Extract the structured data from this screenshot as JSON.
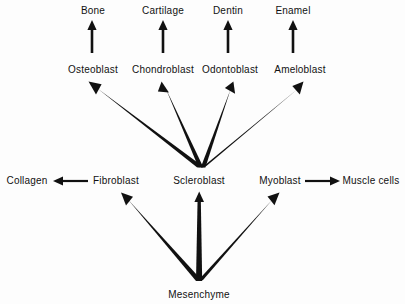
{
  "diagram": {
    "background_color": "#fdfdfd",
    "stroke_color": "#111111",
    "nodes": {
      "bone": "Bone",
      "cartilage": "Cartilage",
      "dentin": "Dentin",
      "enamel": "Enamel",
      "osteoblast": "Osteoblast",
      "chondroblast": "Chondroblast",
      "odontoblast": "Odontoblast",
      "ameloblast": "Ameloblast",
      "collagen": "Collagen",
      "fibroblast": "Fibroblast",
      "scleroblast": "Scleroblast",
      "myoblast": "Myoblast",
      "muscle_cells": "Muscle cells",
      "mesenchyme": "Mesenchyme"
    },
    "edges": [
      {
        "name": "osteoblast-to-bone",
        "from": "osteoblast",
        "to": "bone",
        "style": "vertical-thin"
      },
      {
        "name": "chondroblast-to-cartilage",
        "from": "chondroblast",
        "to": "cartilage",
        "style": "vertical-thin"
      },
      {
        "name": "odontoblast-to-dentin",
        "from": "odontoblast",
        "to": "dentin",
        "style": "vertical-thin"
      },
      {
        "name": "ameloblast-to-enamel",
        "from": "ameloblast",
        "to": "enamel",
        "style": "vertical-thin"
      },
      {
        "name": "scleroblast-to-osteoblast",
        "from": "scleroblast",
        "to": "osteoblast",
        "style": "tapered-fan"
      },
      {
        "name": "scleroblast-to-chondroblast",
        "from": "scleroblast",
        "to": "chondroblast",
        "style": "tapered-fan"
      },
      {
        "name": "scleroblast-to-odontoblast",
        "from": "scleroblast",
        "to": "odontoblast",
        "style": "tapered-fan"
      },
      {
        "name": "scleroblast-to-ameloblast",
        "from": "scleroblast",
        "to": "ameloblast",
        "style": "tapered-fan"
      },
      {
        "name": "fibroblast-to-collagen",
        "from": "fibroblast",
        "to": "collagen",
        "style": "horizontal-thin-left"
      },
      {
        "name": "myoblast-to-muscle-cells",
        "from": "myoblast",
        "to": "muscle_cells",
        "style": "horizontal-thin-right"
      },
      {
        "name": "mesenchyme-to-fibroblast",
        "from": "mesenchyme",
        "to": "fibroblast",
        "style": "tapered-fan"
      },
      {
        "name": "mesenchyme-to-scleroblast",
        "from": "mesenchyme",
        "to": "scleroblast",
        "style": "tapered-fan"
      },
      {
        "name": "mesenchyme-to-myoblast",
        "from": "mesenchyme",
        "to": "myoblast",
        "style": "tapered-fan"
      }
    ]
  }
}
